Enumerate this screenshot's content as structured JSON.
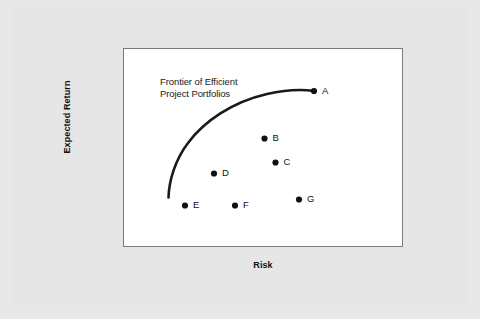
{
  "chart_data": {
    "type": "scatter",
    "title": "",
    "xlabel": "Risk",
    "ylabel": "Expected Return",
    "xlim": [
      0,
      100
    ],
    "ylim": [
      0,
      100
    ],
    "grid": false,
    "legend": null,
    "annotations": [
      {
        "name": "frontier-annotation",
        "line1": "Frontier of Efficient",
        "line2": "Project Portfolios",
        "x": 13,
        "y": 83
      }
    ],
    "series": [
      {
        "name": "Efficient Frontier",
        "type": "line",
        "style": "solid-thick",
        "color": "#1a1a1a",
        "points": [
          {
            "x": 15.0,
            "y": 24.0
          },
          {
            "x": 16.5,
            "y": 34.0
          },
          {
            "x": 20.0,
            "y": 45.0
          },
          {
            "x": 26.0,
            "y": 56.0
          },
          {
            "x": 34.0,
            "y": 65.5
          },
          {
            "x": 44.0,
            "y": 73.5
          },
          {
            "x": 55.0,
            "y": 79.5
          },
          {
            "x": 66.0,
            "y": 83.5
          },
          {
            "x": 68.0,
            "y": 84.0
          }
        ]
      },
      {
        "name": "Project Portfolios",
        "type": "scatter",
        "marker": "filled-circle",
        "color": "#111111",
        "points": [
          {
            "label": "A",
            "x": 68.0,
            "y": 84.0
          },
          {
            "label": "B",
            "x": 50.5,
            "y": 60.5
          },
          {
            "label": "C",
            "x": 54.5,
            "y": 48.5
          },
          {
            "label": "D",
            "x": 32.5,
            "y": 43.0
          },
          {
            "label": "E",
            "x": 22.0,
            "y": 27.0
          },
          {
            "label": "F",
            "x": 40.0,
            "y": 27.0
          },
          {
            "label": "G",
            "x": 63.0,
            "y": 30.0
          }
        ]
      }
    ]
  },
  "axes": {
    "xlabel": "Risk",
    "ylabel": "Expected Return"
  },
  "annotation": {
    "line1": "Frontier of Efficient",
    "line2": "Project Portfolios"
  },
  "points": [
    {
      "label": "A",
      "px": 190.0,
      "py": 42.0,
      "lx": 198.0,
      "ly": 36.5
    },
    {
      "label": "B",
      "px": 140.5,
      "py": 89.5,
      "lx": 148.5,
      "ly": 84.0
    },
    {
      "label": "C",
      "px": 151.5,
      "py": 113.5,
      "lx": 159.5,
      "ly": 108.0
    },
    {
      "label": "D",
      "px": 90.0,
      "py": 124.5,
      "lx": 98.0,
      "ly": 119.0
    },
    {
      "label": "E",
      "px": 61.0,
      "py": 156.5,
      "lx": 69.0,
      "ly": 151.0
    },
    {
      "label": "F",
      "px": 111.0,
      "py": 156.5,
      "lx": 119.0,
      "ly": 151.0
    },
    {
      "label": "G",
      "px": 175.0,
      "py": 150.5,
      "lx": 183.0,
      "ly": 145.0
    }
  ],
  "curve": {
    "path": "M 44.5 148.5 C 45.0 132.0 51.0 111.0 64.0 94.0 C 80.0 72.5 108.0 53.0 143.0 45.0 C 163.0 40.5 180.0 40.5 190.0 42.0"
  },
  "colors": {
    "figure_background": "#e6e6e6",
    "panel_background": "#ffffff",
    "panel_border": "#7a7a7a",
    "curve": "#1a1a1a",
    "marker": "#111111",
    "text": "#111111"
  }
}
